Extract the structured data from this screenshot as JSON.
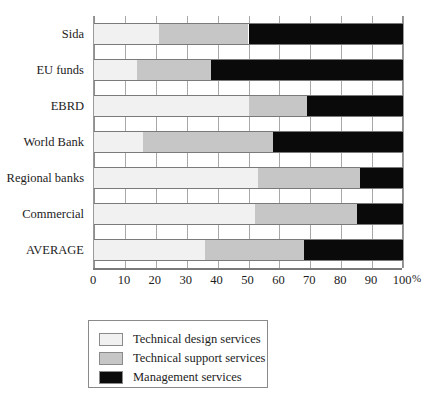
{
  "chart_data": {
    "type": "bar",
    "orientation": "horizontal",
    "stacked": true,
    "stack_unit": "percent",
    "title": "",
    "xlabel": "%",
    "ylabel": "",
    "xlim": [
      0,
      100
    ],
    "xticks": [
      0,
      10,
      20,
      30,
      40,
      50,
      60,
      70,
      80,
      90,
      100
    ],
    "xtick_labels": [
      "0",
      "10",
      "20",
      "30",
      "40",
      "50",
      "60",
      "70",
      "80",
      "90",
      "100"
    ],
    "grid": "vertical",
    "legend_position": "below-left",
    "categories": [
      "Sida",
      "EU funds",
      "EBRD",
      "World Bank",
      "Regional banks",
      "Commercial",
      "AVERAGE"
    ],
    "series": [
      {
        "name": "Technical design services",
        "color": "#f1f1f1",
        "values": [
          21,
          14,
          50,
          16,
          53,
          52,
          36
        ]
      },
      {
        "name": "Technical support services",
        "color": "#c6c6c6",
        "values": [
          29,
          24,
          19,
          42,
          33,
          33,
          32
        ]
      },
      {
        "name": "Management services",
        "color": "#0a0a0a",
        "values": [
          50,
          62,
          31,
          42,
          14,
          15,
          32
        ]
      }
    ]
  },
  "legend": {
    "items": [
      {
        "label": "Technical design services",
        "color": "#f1f1f1"
      },
      {
        "label": "Technical support services",
        "color": "#c6c6c6"
      },
      {
        "label": "Management services",
        "color": "#0a0a0a"
      }
    ]
  }
}
